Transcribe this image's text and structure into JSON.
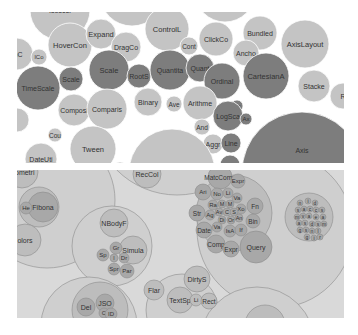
{
  "chart_data": [
    {
      "type": "bubble",
      "title": "",
      "layout": "flat bubble chart (d3 pack, flare classes)",
      "colors": {
        "light": "#c4c4c4",
        "mid": "#9e9e9e",
        "dark": "#7d7d7d",
        "background": "#ffffff"
      },
      "bubbles": [
        {
          "label": "Isoscel",
          "cx": 43,
          "cy": -2,
          "r": 30,
          "shade": "light",
          "fs": 7
        },
        {
          "label": "",
          "cx": 115,
          "cy": -18,
          "r": 32,
          "shade": "light",
          "fs": 7
        },
        {
          "label": "",
          "cx": 208,
          "cy": -20,
          "r": 30,
          "shade": "light",
          "fs": 7
        },
        {
          "label": "mC",
          "cx": 0,
          "cy": 42,
          "r": 16,
          "shade": "light",
          "fs": 7
        },
        {
          "label": "lCo",
          "cx": 22,
          "cy": 45,
          "r": 8,
          "shade": "light",
          "fs": 6
        },
        {
          "label": "HoverCon",
          "cx": 53,
          "cy": 33,
          "r": 22,
          "shade": "light",
          "fs": 7.5
        },
        {
          "label": "Expand",
          "cx": 84,
          "cy": 22,
          "r": 15,
          "shade": "light",
          "fs": 7.5
        },
        {
          "label": "DragCo",
          "cx": 109,
          "cy": 35,
          "r": 15,
          "shade": "light",
          "fs": 7
        },
        {
          "label": "ControlL",
          "cx": 150,
          "cy": 17,
          "r": 22,
          "shade": "light",
          "fs": 7.5
        },
        {
          "label": "ClickCo",
          "cx": 199,
          "cy": 27,
          "r": 17,
          "shade": "light",
          "fs": 7
        },
        {
          "label": "Cont",
          "cx": 172,
          "cy": 34,
          "r": 9,
          "shade": "light",
          "fs": 6.5
        },
        {
          "label": "Bundled",
          "cx": 243,
          "cy": 21,
          "r": 17,
          "shade": "light",
          "fs": 7
        },
        {
          "label": "Ancho",
          "cx": 229,
          "cy": 41,
          "r": 13,
          "shade": "light",
          "fs": 7
        },
        {
          "label": "AxisLayout",
          "cx": 288,
          "cy": 32,
          "r": 24,
          "shade": "light",
          "fs": 7.5
        },
        {
          "label": "TimeScale",
          "cx": 21,
          "cy": 76,
          "r": 22,
          "shade": "dark",
          "fs": 7
        },
        {
          "label": "Scale",
          "cx": 54,
          "cy": 67,
          "r": 12,
          "shade": "dark",
          "fs": 7
        },
        {
          "label": "Scale",
          "cx": 92,
          "cy": 58,
          "r": 20,
          "shade": "dark",
          "fs": 7.5
        },
        {
          "label": "RootS",
          "cx": 122,
          "cy": 64,
          "r": 12,
          "shade": "dark",
          "fs": 7
        },
        {
          "label": "Quantita",
          "cx": 153,
          "cy": 58,
          "r": 20,
          "shade": "dark",
          "fs": 7
        },
        {
          "label": "Quant",
          "cx": 183,
          "cy": 56,
          "r": 14,
          "shade": "dark",
          "fs": 7
        },
        {
          "label": "Ordinal",
          "cx": 205,
          "cy": 69,
          "r": 18,
          "shade": "dark",
          "fs": 7
        },
        {
          "label": "CartesianA",
          "cx": 249,
          "cy": 64,
          "r": 23,
          "shade": "dark",
          "fs": 7.5
        },
        {
          "label": "Stacke",
          "cx": 297,
          "cy": 74,
          "r": 16,
          "shade": "light",
          "fs": 7
        },
        {
          "label": "R",
          "cx": 326,
          "cy": 84,
          "r": 13,
          "shade": "light",
          "fs": 7
        },
        {
          "label": "",
          "cx": 0,
          "cy": 108,
          "r": 12,
          "shade": "light",
          "fs": 7
        },
        {
          "label": "Composi",
          "cx": 57,
          "cy": 98,
          "r": 16,
          "shade": "light",
          "fs": 7
        },
        {
          "label": "Comparis",
          "cx": 90,
          "cy": 97,
          "r": 20,
          "shade": "light",
          "fs": 7
        },
        {
          "label": "Binary",
          "cx": 131,
          "cy": 90,
          "r": 14,
          "shade": "light",
          "fs": 7
        },
        {
          "label": "Ave",
          "cx": 157,
          "cy": 92,
          "r": 8,
          "shade": "light",
          "fs": 6.5
        },
        {
          "label": "Arithme",
          "cx": 183,
          "cy": 91,
          "r": 17,
          "shade": "light",
          "fs": 7
        },
        {
          "label": "Ax",
          "cx": 220,
          "cy": 94,
          "r": 6,
          "shade": "dark",
          "fs": 6
        },
        {
          "label": "LogSca",
          "cx": 211,
          "cy": 104,
          "r": 15,
          "shade": "dark",
          "fs": 7
        },
        {
          "label": "Ax",
          "cx": 229,
          "cy": 107,
          "r": 6,
          "shade": "dark",
          "fs": 6
        },
        {
          "label": "And",
          "cx": 185,
          "cy": 115,
          "r": 8,
          "shade": "light",
          "fs": 6.5
        },
        {
          "label": "Aggr",
          "cx": 196,
          "cy": 132,
          "r": 10,
          "shade": "light",
          "fs": 7
        },
        {
          "label": "Line",
          "cx": 214,
          "cy": 131,
          "r": 10,
          "shade": "dark",
          "fs": 7
        },
        {
          "label": "",
          "cx": 213,
          "cy": 153,
          "r": 10,
          "shade": "dark",
          "fs": 7
        },
        {
          "label": "Cou",
          "cx": 38,
          "cy": 123,
          "r": 7,
          "shade": "light",
          "fs": 6.5
        },
        {
          "label": "Tween",
          "cx": 76,
          "cy": 137,
          "r": 23,
          "shade": "light",
          "fs": 7.5
        },
        {
          "label": "DateUti",
          "cx": 24,
          "cy": 147,
          "r": 16,
          "shade": "light",
          "fs": 7
        },
        {
          "label": "Tran",
          "cx": 103,
          "cy": 157,
          "r": 7,
          "shade": "light",
          "fs": 6.5
        },
        {
          "label": "Transitioner",
          "cx": 155,
          "cy": 160,
          "r": 43,
          "shade": "light",
          "fs": 7.5
        },
        {
          "label": "Axis",
          "cx": 285,
          "cy": 160,
          "r": 60,
          "shade": "dark",
          "fs": 7,
          "ly": 138
        }
      ]
    },
    {
      "type": "circle-packing",
      "title": "",
      "layout": "nested circle packing (d3 pack, flare hierarchy)",
      "colors": {
        "background": "#d9d9d9",
        "outer": "#cfcfcf",
        "mid": "#bdbdbd",
        "inner": "#a8a8a8",
        "stroke": "#8c8c8c"
      },
      "circles": [
        {
          "label": "",
          "cx": 160,
          "cy": -60,
          "r": 85,
          "depth": 1
        },
        {
          "label": "",
          "cx": 258,
          "cy": 60,
          "r": 78,
          "depth": 1
        },
        {
          "label": "",
          "cx": 30,
          "cy": 30,
          "r": 68,
          "depth": 1
        },
        {
          "label": "",
          "cx": 95,
          "cy": 76,
          "r": 40,
          "depth": 1
        },
        {
          "label": "",
          "cx": 72,
          "cy": 155,
          "r": 48,
          "depth": 1
        },
        {
          "label": "",
          "cx": 165,
          "cy": 140,
          "r": 36,
          "depth": 1
        },
        {
          "label": "",
          "cx": 240,
          "cy": 175,
          "r": 58,
          "depth": 1
        },
        {
          "label": "Isometri",
          "cx": 5,
          "cy": 2,
          "r": 16,
          "depth": 2,
          "fs": 7
        },
        {
          "label": "RecCol",
          "cx": 130,
          "cy": 4,
          "r": 14,
          "depth": 2,
          "fs": 7
        },
        {
          "label": "",
          "cx": 22,
          "cy": 37,
          "r": 20,
          "depth": 2
        },
        {
          "label": "Fibona",
          "cx": 26,
          "cy": 37,
          "r": 15,
          "depth": 3,
          "fs": 7
        },
        {
          "label": "He",
          "cx": 9,
          "cy": 38,
          "r": 6,
          "depth": 3,
          "fs": 6
        },
        {
          "label": "olors",
          "cx": 8,
          "cy": 70,
          "r": 16,
          "depth": 2,
          "fs": 7
        },
        {
          "label": "NBodyF",
          "cx": 97,
          "cy": 53,
          "r": 14,
          "depth": 2,
          "fs": 7
        },
        {
          "label": "Simula",
          "cx": 116,
          "cy": 80,
          "r": 14,
          "depth": 2,
          "fs": 7
        },
        {
          "label": "Gr",
          "cx": 99,
          "cy": 78,
          "r": 6,
          "depth": 3,
          "fs": 6
        },
        {
          "label": "Sp",
          "cx": 86,
          "cy": 85,
          "r": 6,
          "depth": 3,
          "fs": 6
        },
        {
          "label": "I",
          "cx": 97,
          "cy": 88,
          "r": 4,
          "depth": 3,
          "fs": 5
        },
        {
          "label": "Dr",
          "cx": 107,
          "cy": 88,
          "r": 5,
          "depth": 3,
          "fs": 6
        },
        {
          "label": "Spr",
          "cx": 97,
          "cy": 99,
          "r": 6,
          "depth": 3,
          "fs": 6
        },
        {
          "label": "Par",
          "cx": 110,
          "cy": 101,
          "r": 7,
          "depth": 3,
          "fs": 6
        },
        {
          "label": "Flar",
          "cx": 137,
          "cy": 120,
          "r": 10,
          "depth": 2,
          "fs": 7
        },
        {
          "label": "",
          "cx": 83,
          "cy": 140,
          "r": 28,
          "depth": 2
        },
        {
          "label": "Del",
          "cx": 69,
          "cy": 137,
          "r": 9,
          "depth": 3,
          "fs": 7
        },
        {
          "label": "JSO",
          "cx": 88,
          "cy": 133,
          "r": 9,
          "depth": 3,
          "fs": 7
        },
        {
          "label": "C",
          "cx": 87,
          "cy": 143,
          "r": 5,
          "depth": 3,
          "fs": 6
        },
        {
          "label": "ID",
          "cx": 94,
          "cy": 144,
          "r": 6,
          "depth": 3,
          "fs": 6
        },
        {
          "label": "TextSp",
          "cx": 163,
          "cy": 130,
          "r": 13,
          "depth": 2,
          "fs": 7
        },
        {
          "label": "DirtyS",
          "cx": 180,
          "cy": 109,
          "r": 13,
          "depth": 2,
          "fs": 7
        },
        {
          "label": "Li",
          "cx": 179,
          "cy": 130,
          "r": 6,
          "depth": 2,
          "fs": 6
        },
        {
          "label": "Rect",
          "cx": 192,
          "cy": 131,
          "r": 8,
          "depth": 2,
          "fs": 6.5
        },
        {
          "label": "",
          "cx": 217,
          "cy": 43,
          "r": 38,
          "depth": 2
        },
        {
          "label": "MatcComp",
          "cx": 203,
          "cy": 7,
          "r": 12,
          "depth": 3,
          "fs": 6.5
        },
        {
          "label": "Expr",
          "cx": 221,
          "cy": 11,
          "r": 7,
          "depth": 3,
          "fs": 6
        },
        {
          "label": "Ari",
          "cx": 186,
          "cy": 22,
          "r": 8,
          "depth": 3,
          "fs": 6
        },
        {
          "label": "No",
          "cx": 200,
          "cy": 24,
          "r": 6,
          "depth": 3,
          "fs": 6
        },
        {
          "label": "Li",
          "cx": 211,
          "cy": 23,
          "r": 5,
          "depth": 3,
          "fs": 6
        },
        {
          "label": "Va",
          "cx": 220,
          "cy": 28,
          "r": 5,
          "depth": 3,
          "fs": 6
        },
        {
          "label": "Ra",
          "cx": 196,
          "cy": 35,
          "r": 5,
          "depth": 3,
          "fs": 6
        },
        {
          "label": "M",
          "cx": 205,
          "cy": 34,
          "r": 4,
          "depth": 3,
          "fs": 5.5
        },
        {
          "label": "M",
          "cx": 213,
          "cy": 34,
          "r": 4,
          "depth": 3,
          "fs": 5.5
        },
        {
          "label": "Xo",
          "cx": 224,
          "cy": 39,
          "r": 5,
          "depth": 3,
          "fs": 6
        },
        {
          "label": "Fn",
          "cx": 238,
          "cy": 36,
          "r": 8,
          "depth": 3,
          "fs": 6.5
        },
        {
          "label": "Str",
          "cx": 180,
          "cy": 43,
          "r": 8,
          "depth": 3,
          "fs": 6.5
        },
        {
          "label": "Ag",
          "cx": 193,
          "cy": 45,
          "r": 5,
          "depth": 3,
          "fs": 6
        },
        {
          "label": "Av",
          "cx": 202,
          "cy": 42,
          "r": 4,
          "depth": 3,
          "fs": 5.5
        },
        {
          "label": "C",
          "cx": 210,
          "cy": 42,
          "r": 4,
          "depth": 3,
          "fs": 5.5
        },
        {
          "label": "S",
          "cx": 217,
          "cy": 42,
          "r": 4,
          "depth": 3,
          "fs": 5.5
        },
        {
          "label": "Di",
          "cx": 205,
          "cy": 50,
          "r": 4,
          "depth": 3,
          "fs": 5.5
        },
        {
          "label": "Or",
          "cx": 214,
          "cy": 50,
          "r": 4,
          "depth": 3,
          "fs": 5.5
        },
        {
          "label": "An",
          "cx": 222,
          "cy": 48,
          "r": 4,
          "depth": 3,
          "fs": 5.5
        },
        {
          "label": "Bin",
          "cx": 236,
          "cy": 51,
          "r": 7,
          "depth": 3,
          "fs": 6.5
        },
        {
          "label": "Date",
          "cx": 187,
          "cy": 60,
          "r": 8,
          "depth": 3,
          "fs": 6.5
        },
        {
          "label": "Va",
          "cx": 200,
          "cy": 57,
          "r": 5,
          "depth": 3,
          "fs": 6
        },
        {
          "label": "IsA",
          "cx": 213,
          "cy": 61,
          "r": 6,
          "depth": 3,
          "fs": 6
        },
        {
          "label": "If",
          "cx": 224,
          "cy": 60,
          "r": 6,
          "depth": 3,
          "fs": 6
        },
        {
          "label": "Comp",
          "cx": 199,
          "cy": 74,
          "r": 9,
          "depth": 3,
          "fs": 6.5
        },
        {
          "label": "Expr",
          "cx": 214,
          "cy": 79,
          "r": 8,
          "depth": 3,
          "fs": 6.5
        },
        {
          "label": "Query",
          "cx": 239,
          "cy": 77,
          "r": 16,
          "depth": 3,
          "fs": 7
        },
        {
          "label": "",
          "cx": 292,
          "cy": 47,
          "r": 24,
          "depth": 2
        },
        {
          "label": "n",
          "cx": 283,
          "cy": 33,
          "r": 3,
          "depth": 3,
          "fs": 5
        },
        {
          "label": "i",
          "cx": 291,
          "cy": 31,
          "r": 3,
          "depth": 3,
          "fs": 5
        },
        {
          "label": "d",
          "cx": 298,
          "cy": 33,
          "r": 3,
          "depth": 3,
          "fs": 5
        },
        {
          "label": "s",
          "cx": 281,
          "cy": 40,
          "r": 3,
          "depth": 3,
          "fs": 5
        },
        {
          "label": "a",
          "cx": 287,
          "cy": 39,
          "r": 3,
          "depth": 3,
          "fs": 5
        },
        {
          "label": "c",
          "cx": 293,
          "cy": 39,
          "r": 3,
          "depth": 3,
          "fs": 5
        },
        {
          "label": "c",
          "cx": 299,
          "cy": 40,
          "r": 3,
          "depth": 3,
          "fs": 5
        },
        {
          "label": "s",
          "cx": 305,
          "cy": 40,
          "r": 3,
          "depth": 3,
          "fs": 5
        },
        {
          "label": "m",
          "cx": 280,
          "cy": 47,
          "r": 3,
          "depth": 3,
          "fs": 5
        },
        {
          "label": "v",
          "cx": 286,
          "cy": 46,
          "r": 3,
          "depth": 3,
          "fs": 5
        },
        {
          "label": "a",
          "cx": 292,
          "cy": 46,
          "r": 3,
          "depth": 3,
          "fs": 5
        },
        {
          "label": "e",
          "cx": 299,
          "cy": 47,
          "r": 3,
          "depth": 3,
          "fs": 5
        },
        {
          "label": "a",
          "cx": 306,
          "cy": 47,
          "r": 3,
          "depth": 3,
          "fs": 5
        },
        {
          "label": "a",
          "cx": 282,
          "cy": 53,
          "r": 3,
          "depth": 3,
          "fs": 5
        },
        {
          "label": "s",
          "cx": 288,
          "cy": 53,
          "r": 3,
          "depth": 3,
          "fs": 5
        },
        {
          "label": "d",
          "cx": 295,
          "cy": 54,
          "r": 3,
          "depth": 3,
          "fs": 5
        },
        {
          "label": "s",
          "cx": 301,
          "cy": 54,
          "r": 3,
          "depth": 3,
          "fs": 5
        },
        {
          "label": "m",
          "cx": 307,
          "cy": 54,
          "r": 3,
          "depth": 3,
          "fs": 5
        },
        {
          "label": "g",
          "cx": 283,
          "cy": 60,
          "r": 3,
          "depth": 3,
          "fs": 5
        },
        {
          "label": "s",
          "cx": 289,
          "cy": 60,
          "r": 3,
          "depth": 3,
          "fs": 5
        },
        {
          "label": "n",
          "cx": 295,
          "cy": 61,
          "r": 3,
          "depth": 3,
          "fs": 5
        },
        {
          "label": "l",
          "cx": 301,
          "cy": 61,
          "r": 3,
          "depth": 3,
          "fs": 5
        },
        {
          "label": "g",
          "cx": 290,
          "cy": 67,
          "r": 3,
          "depth": 3,
          "fs": 5
        },
        {
          "label": "i",
          "cx": 297,
          "cy": 68,
          "r": 3,
          "depth": 3,
          "fs": 5
        },
        {
          "label": "r",
          "cx": 303,
          "cy": 67,
          "r": 3,
          "depth": 3,
          "fs": 5
        },
        {
          "label": "",
          "cx": 248,
          "cy": 155,
          "r": 20,
          "depth": 2
        }
      ]
    }
  ]
}
